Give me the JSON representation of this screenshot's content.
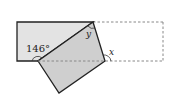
{
  "diagram": {
    "labels": {
      "angle_given": "146°",
      "angle_y": "y",
      "angle_x": "x"
    },
    "colors": {
      "fill": "#d9d9d9",
      "stroke": "#222222",
      "dashed": "#888888"
    }
  }
}
